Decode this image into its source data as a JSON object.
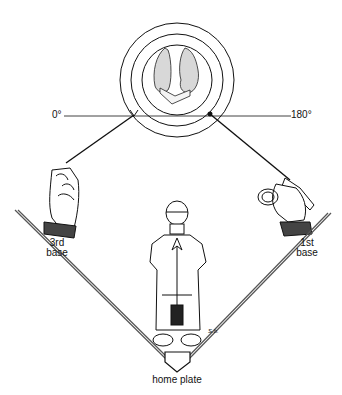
{
  "labels": {
    "angle_left": "0°",
    "angle_right": "180°",
    "third_base": [
      "3rd",
      "base"
    ],
    "first_base": [
      "1st",
      "base"
    ],
    "home_plate": "home plate",
    "signature": "S.b."
  },
  "colors": {
    "ink": "#111111",
    "background": "#ffffff"
  }
}
